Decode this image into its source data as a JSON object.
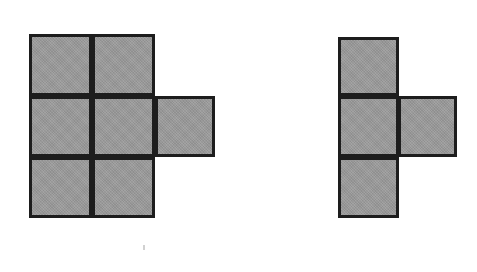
{
  "page": {
    "background_color": "#ffffff",
    "width": 477,
    "height": 272
  },
  "style": {
    "fill_color": "#9a9a9a",
    "stroke_color": "#1d1d1d",
    "stroke_width": 3
  },
  "figures": [
    {
      "id": "left-figure",
      "name": "hexomino-p-shape",
      "label": "",
      "cell_width": 62,
      "cell_height": 61,
      "cells": [
        {
          "name": "left-cell-r1c1",
          "x": 29,
          "y": 34,
          "w": 63,
          "h": 62
        },
        {
          "name": "left-cell-r1c2",
          "x": 92,
          "y": 34,
          "w": 63,
          "h": 62
        },
        {
          "name": "left-cell-r2c1",
          "x": 29,
          "y": 96,
          "w": 63,
          "h": 61
        },
        {
          "name": "left-cell-r2c2",
          "x": 92,
          "y": 96,
          "w": 63,
          "h": 61
        },
        {
          "name": "left-cell-r2c3",
          "x": 155,
          "y": 96,
          "w": 60,
          "h": 61
        },
        {
          "name": "left-cell-r3c1",
          "x": 29,
          "y": 157,
          "w": 63,
          "h": 61
        },
        {
          "name": "left-cell-r3c2",
          "x": 92,
          "y": 157,
          "w": 63,
          "h": 61
        }
      ]
    },
    {
      "id": "right-figure",
      "name": "tetromino-t-shape",
      "label": "",
      "cell_width": 60,
      "cell_height": 60,
      "cells": [
        {
          "name": "right-cell-r1c1",
          "x": 338,
          "y": 37,
          "w": 61,
          "h": 59
        },
        {
          "name": "right-cell-r2c1",
          "x": 338,
          "y": 96,
          "w": 61,
          "h": 61
        },
        {
          "name": "right-cell-r2c2",
          "x": 398,
          "y": 96,
          "w": 59,
          "h": 61
        },
        {
          "name": "right-cell-r3c1",
          "x": 338,
          "y": 157,
          "w": 61,
          "h": 61
        }
      ]
    }
  ],
  "artifacts": [
    {
      "name": "scan-speck",
      "x": 143,
      "y": 245,
      "w": 2,
      "h": 5
    }
  ]
}
